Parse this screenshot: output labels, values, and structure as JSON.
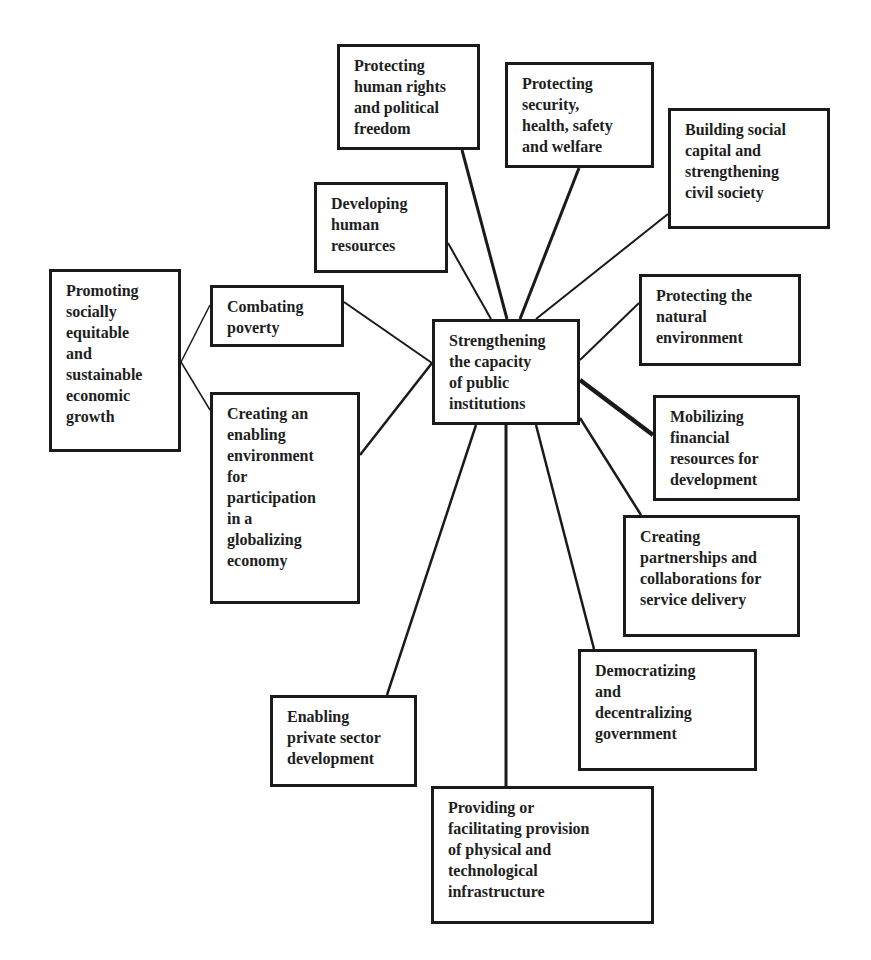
{
  "diagram": {
    "center": {
      "id": "center",
      "label": "Strengthening\nthe capacity\nof public\ninstitutions",
      "box": [
        432,
        319,
        148,
        106
      ]
    },
    "nodes": [
      {
        "id": "human-rights",
        "label": "Protecting\nhuman rights\nand political\nfreedom",
        "box": [
          337,
          44,
          143,
          106
        ]
      },
      {
        "id": "security",
        "label": "Protecting\nsecurity,\nhealth, safety\nand welfare",
        "box": [
          505,
          62,
          149,
          106
        ]
      },
      {
        "id": "social-capital",
        "label": "Building social\ncapital and\nstrengthening\ncivil society",
        "box": [
          668,
          108,
          162,
          121
        ]
      },
      {
        "id": "human-resources",
        "label": "Developing\nhuman\nresources",
        "box": [
          314,
          182,
          134,
          91
        ]
      },
      {
        "id": "natural-environment",
        "label": "Protecting the\nnatural\nenvironment",
        "box": [
          639,
          274,
          162,
          92
        ]
      },
      {
        "id": "financial-resources",
        "label": "Mobilizing\nfinancial\nresources for\ndevelopment",
        "box": [
          653,
          395,
          147,
          106
        ]
      },
      {
        "id": "partnerships",
        "label": "Creating\npartnerships and\ncollaborations for\nservice delivery",
        "box": [
          623,
          515,
          177,
          122
        ]
      },
      {
        "id": "democratizing",
        "label": "Democratizing\nand\ndecentralizing\ngovernment",
        "box": [
          578,
          649,
          179,
          122
        ]
      },
      {
        "id": "infrastructure",
        "label": "Providing or\nfacilitating provision\nof physical and\ntechnological\ninfrastructure",
        "box": [
          431,
          786,
          223,
          138
        ]
      },
      {
        "id": "private-sector",
        "label": "Enabling\nprivate sector\ndevelopment",
        "box": [
          270,
          695,
          147,
          92
        ]
      },
      {
        "id": "poverty",
        "label": "Combating\npoverty",
        "box": [
          210,
          285,
          134,
          62
        ]
      },
      {
        "id": "globalizing",
        "label": "Creating an\nenabling\nenvironment\nfor\nparticipation\nin a\nglobalizing\neconomy",
        "box": [
          210,
          392,
          150,
          212
        ]
      },
      {
        "id": "economic-growth",
        "label": "Promoting\nsocially\nequitable\nand\nsustainable\neconomic\ngrowth",
        "box": [
          49,
          269,
          132,
          183
        ]
      }
    ],
    "edges": [
      {
        "from": "human-rights",
        "to": "center",
        "points": [
          462,
          150,
          507,
          319
        ],
        "width": 3
      },
      {
        "from": "security",
        "to": "center",
        "points": [
          579,
          168,
          520,
          319
        ],
        "width": 3
      },
      {
        "from": "social-capital",
        "to": "center",
        "points": [
          668,
          214,
          536,
          319
        ],
        "width": 2
      },
      {
        "from": "human-resources",
        "to": "center",
        "points": [
          448,
          243,
          491,
          319
        ],
        "width": 2
      },
      {
        "from": "natural-environment",
        "to": "center",
        "points": [
          639,
          303,
          580,
          360
        ],
        "width": 2
      },
      {
        "from": "financial-resources",
        "to": "center",
        "points": [
          653,
          435,
          580,
          380
        ],
        "width": 4.5
      },
      {
        "from": "partnerships",
        "to": "center",
        "points": [
          641,
          515,
          580,
          418
        ],
        "width": 2.5
      },
      {
        "from": "democratizing",
        "to": "center",
        "points": [
          594,
          649,
          536,
          425
        ],
        "width": 2.5
      },
      {
        "from": "infrastructure",
        "to": "center",
        "points": [
          506,
          786,
          506,
          425
        ],
        "width": 3
      },
      {
        "from": "private-sector",
        "to": "center",
        "points": [
          387,
          695,
          476,
          425
        ],
        "width": 2.5
      },
      {
        "from": "poverty",
        "to": "center",
        "points": [
          344,
          302,
          432,
          363
        ],
        "width": 2
      },
      {
        "from": "globalizing",
        "to": "center",
        "points": [
          360,
          455,
          432,
          363
        ],
        "width": 2.5
      },
      {
        "from": "economic-growth",
        "to": "poverty",
        "points": [
          181,
          362,
          210,
          305
        ],
        "width": 1.5
      },
      {
        "from": "economic-growth",
        "to": "globalizing",
        "points": [
          181,
          362,
          210,
          410
        ],
        "width": 1.5
      }
    ],
    "colors": {
      "stroke": "#1a1a1a",
      "text": "#1e1e1e",
      "background": "#ffffff"
    }
  }
}
